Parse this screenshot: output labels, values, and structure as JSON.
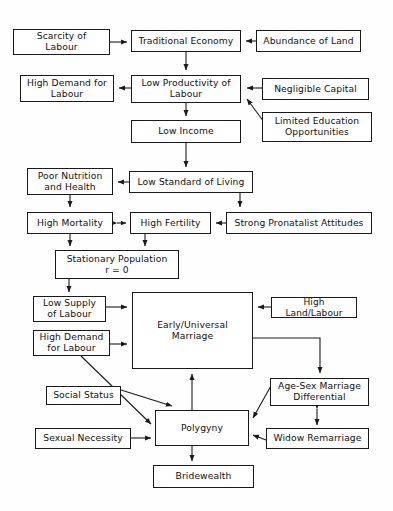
{
  "diagram": {
    "type": "flowchart",
    "stroke_color": "#1a1a1a",
    "box_fill": "#ffffff",
    "background": "#fefefe",
    "nodes": [
      {
        "id": "scarcity-of-labour",
        "label": "Scarcity of\nLabour",
        "x": 13,
        "y": 29,
        "w": 97,
        "h": 26,
        "font": 9.2
      },
      {
        "id": "traditional-economy",
        "label": "Traditional Economy",
        "x": 131,
        "y": 30,
        "w": 110,
        "h": 22,
        "font": 9.2
      },
      {
        "id": "abundance-of-land",
        "label": "Abundance of Land",
        "x": 256,
        "y": 30,
        "w": 105,
        "h": 22,
        "font": 9.2
      },
      {
        "id": "high-demand-for-labour-top",
        "label": "High Demand for\nLabour",
        "x": 20,
        "y": 75,
        "w": 94,
        "h": 27,
        "font": 9.2
      },
      {
        "id": "low-productivity-of-labour",
        "label": "Low Productivity of\nLabour",
        "x": 131,
        "y": 75,
        "w": 110,
        "h": 28,
        "font": 9.2
      },
      {
        "id": "negligible-capital",
        "label": "Negligible Capital",
        "x": 262,
        "y": 78,
        "w": 107,
        "h": 22,
        "font": 9.2
      },
      {
        "id": "low-income",
        "label": "Low Income",
        "x": 131,
        "y": 120,
        "w": 110,
        "h": 23,
        "font": 9.2
      },
      {
        "id": "limited-education-opportunities",
        "label": "Limited Education\nOpportunities",
        "x": 262,
        "y": 112,
        "w": 110,
        "h": 30,
        "font": 9.2
      },
      {
        "id": "poor-nutrition-and-health",
        "label": "Poor Nutrition\nand Health",
        "x": 27,
        "y": 168,
        "w": 86,
        "h": 27,
        "font": 9.2
      },
      {
        "id": "low-standard-of-living",
        "label": "Low Standard of Living",
        "x": 129,
        "y": 171,
        "w": 124,
        "h": 22,
        "font": 9.2
      },
      {
        "id": "high-mortality",
        "label": "High Mortality",
        "x": 27,
        "y": 212,
        "w": 86,
        "h": 22,
        "font": 9.2
      },
      {
        "id": "high-fertility",
        "label": "High Fertility",
        "x": 130,
        "y": 212,
        "w": 81,
        "h": 22,
        "font": 9.2
      },
      {
        "id": "strong-pronatalist-attitudes",
        "label": "Strong Pronatalist Attitudes",
        "x": 226,
        "y": 212,
        "w": 146,
        "h": 22,
        "font": 9.2
      },
      {
        "id": "stationary-population",
        "label": "Stationary Population\nr = 0",
        "x": 55,
        "y": 250,
        "w": 124,
        "h": 29,
        "font": 9.2
      },
      {
        "id": "low-supply-of-labour",
        "label": "Low Supply\nof Labour",
        "x": 33,
        "y": 296,
        "w": 73,
        "h": 26,
        "font": 9.2
      },
      {
        "id": "early-universal-marriage",
        "label": "Early/Universal\nMarriage",
        "x": 132,
        "y": 292,
        "w": 121,
        "h": 77,
        "font": 9.2
      },
      {
        "id": "high-land-labour",
        "label": "High Land/Labour",
        "x": 271,
        "y": 297,
        "w": 86,
        "h": 21,
        "font": 9.0
      },
      {
        "id": "high-demand-for-labour-bottom",
        "label": "High Demand\nfor Labour",
        "x": 33,
        "y": 330,
        "w": 77,
        "h": 26,
        "font": 9.2
      },
      {
        "id": "age-sex-marriage-differential",
        "label": "Age-Sex Marriage\nDifferential",
        "x": 270,
        "y": 378,
        "w": 99,
        "h": 28,
        "font": 9.2
      },
      {
        "id": "social-status",
        "label": "Social Status",
        "x": 46,
        "y": 386,
        "w": 75,
        "h": 19,
        "font": 9.2
      },
      {
        "id": "polygyny",
        "label": "Polygyny",
        "x": 155,
        "y": 410,
        "w": 94,
        "h": 36,
        "font": 9.2
      },
      {
        "id": "sexual-necessity",
        "label": "Sexual Necessity",
        "x": 35,
        "y": 428,
        "w": 96,
        "h": 21,
        "font": 9.2
      },
      {
        "id": "widow-remarriage",
        "label": "Widow Remarriage",
        "x": 266,
        "y": 428,
        "w": 103,
        "h": 21,
        "font": 9.2
      },
      {
        "id": "bridewealth",
        "label": "Bridewealth",
        "x": 153,
        "y": 465,
        "w": 101,
        "h": 23,
        "font": 9.2
      }
    ],
    "edges": [
      {
        "id": "scarcity-to-traditional-economy",
        "from": "scarcity-of-labour",
        "to": "traditional-economy",
        "arrows": "end"
      },
      {
        "id": "abundance-to-traditional-economy",
        "from": "abundance-of-land",
        "to": "traditional-economy",
        "arrows": "end"
      },
      {
        "id": "traditional-economy-to-low-productivity",
        "from": "traditional-economy",
        "to": "low-productivity-of-labour",
        "arrows": "end"
      },
      {
        "id": "low-productivity-to-high-demand",
        "from": "low-productivity-of-labour",
        "to": "high-demand-for-labour-top",
        "arrows": "end"
      },
      {
        "id": "negligible-capital-to-low-productivity",
        "from": "negligible-capital",
        "to": "low-productivity-of-labour",
        "arrows": "end"
      },
      {
        "id": "limited-education-to-low-productivity",
        "from": "limited-education-opportunities",
        "to": "low-productivity-of-labour",
        "arrows": "end"
      },
      {
        "id": "low-productivity-to-low-income",
        "from": "low-productivity-of-labour",
        "to": "low-income",
        "arrows": "end"
      },
      {
        "id": "low-income-to-low-standard",
        "from": "low-income",
        "to": "low-standard-of-living",
        "arrows": "end"
      },
      {
        "id": "low-standard-to-poor-nutrition",
        "from": "low-standard-of-living",
        "to": "poor-nutrition-and-health",
        "arrows": "end"
      },
      {
        "id": "low-standard-to-strong-pronatalist",
        "from": "low-standard-of-living",
        "to": "strong-pronatalist-attitudes",
        "arrows": "end"
      },
      {
        "id": "poor-nutrition-to-high-mortality",
        "from": "poor-nutrition-and-health",
        "to": "high-mortality",
        "arrows": "end"
      },
      {
        "id": "high-mortality-high-fertility",
        "from": "high-fertility",
        "to": "high-mortality",
        "arrows": "both"
      },
      {
        "id": "strong-pronatalist-to-high-fertility",
        "from": "strong-pronatalist-attitudes",
        "to": "high-fertility",
        "arrows": "end"
      },
      {
        "id": "high-mortality-to-stationary-population",
        "from": "high-mortality",
        "to": "stationary-population",
        "arrows": "end"
      },
      {
        "id": "high-fertility-to-stationary-population",
        "from": "high-fertility",
        "to": "stationary-population",
        "arrows": "end"
      },
      {
        "id": "stationary-population-to-low-supply",
        "from": "stationary-population",
        "to": "low-supply-of-labour",
        "arrows": "end"
      },
      {
        "id": "low-supply-to-early-universal-marriage",
        "from": "low-supply-of-labour",
        "to": "early-universal-marriage",
        "arrows": "end"
      },
      {
        "id": "high-demand-to-early-universal-marriage",
        "from": "high-demand-for-labour-bottom",
        "to": "early-universal-marriage",
        "arrows": "end"
      },
      {
        "id": "high-land-labour-to-early-universal-marriage",
        "from": "high-land-labour",
        "to": "early-universal-marriage",
        "arrows": "end"
      },
      {
        "id": "early-universal-marriage-to-age-sex",
        "from": "early-universal-marriage",
        "to": "age-sex-marriage-differential",
        "arrows": "end"
      },
      {
        "id": "high-demand-to-polygyny",
        "from": "high-demand-for-labour-bottom",
        "to": "polygyny",
        "arrows": "end"
      },
      {
        "id": "social-status-to-polygyny",
        "from": "social-status",
        "to": "polygyny",
        "arrows": "end"
      },
      {
        "id": "sexual-necessity-to-polygyny",
        "from": "sexual-necessity",
        "to": "polygyny",
        "arrows": "end"
      },
      {
        "id": "polygyny-to-early-universal-marriage",
        "from": "polygyny",
        "to": "early-universal-marriage",
        "arrows": "end"
      },
      {
        "id": "age-sex-to-polygyny",
        "from": "age-sex-marriage-differential",
        "to": "polygyny",
        "arrows": "end"
      },
      {
        "id": "widow-remarriage-to-polygyny",
        "from": "widow-remarriage",
        "to": "polygyny",
        "arrows": "end"
      },
      {
        "id": "age-sex-widow-remarriage",
        "from": "age-sex-marriage-differential",
        "to": "widow-remarriage",
        "arrows": "both"
      },
      {
        "id": "polygyny-to-bridewealth",
        "from": "polygyny",
        "to": "bridewealth",
        "arrows": "end"
      }
    ]
  }
}
